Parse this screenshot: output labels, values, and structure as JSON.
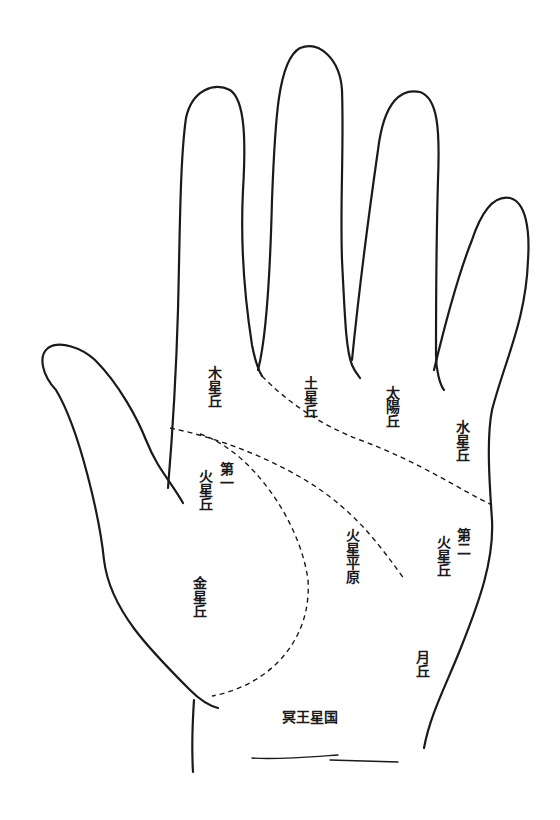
{
  "diagram": {
    "title": "",
    "labels": {
      "jupiter": "木星丘",
      "saturn": "土星丘",
      "sun": "太陽丘",
      "mercury": "水星丘",
      "mars1_prefix": "第一",
      "mars1": "火星丘",
      "mars_plain": "火星平原",
      "mars2_prefix": "第二",
      "mars2": "火星丘",
      "venus": "金星丘",
      "moon": "月丘",
      "pluto": "冥王星国"
    },
    "colors": {
      "line": "#1a1a1a",
      "background": "#ffffff"
    }
  }
}
